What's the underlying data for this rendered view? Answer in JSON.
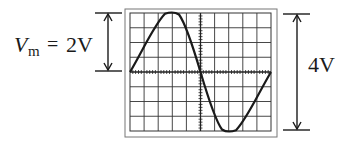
{
  "diagram": {
    "type": "oscilloscope-sine-wave",
    "left_annotation": {
      "symbol": "V",
      "subscript": "m",
      "equals": "=",
      "value": "2V"
    },
    "right_annotation": {
      "value": "4V"
    },
    "screen": {
      "grid_columns": 10,
      "grid_rows": 8,
      "waveform": "one full sine cycle, positive half first"
    },
    "colors": {
      "line": "#1a1a1a",
      "grid": "#333333",
      "frame": "#555555",
      "background": "#ffffff"
    }
  }
}
